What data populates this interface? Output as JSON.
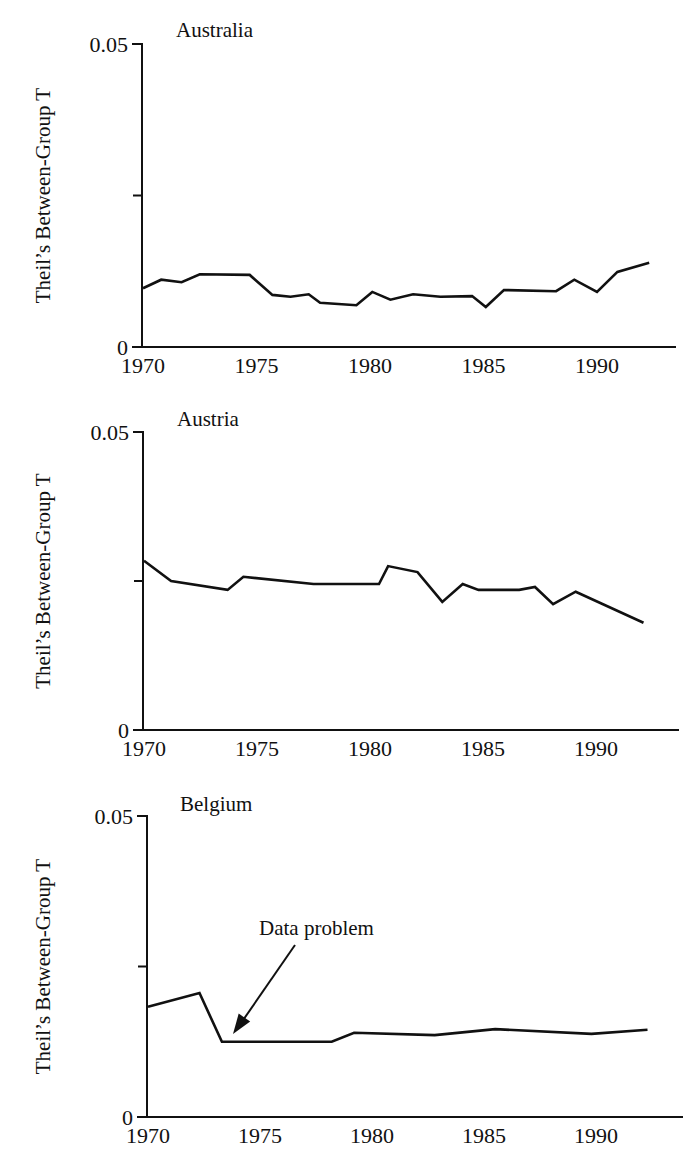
{
  "figure": {
    "y_axis_label": "Theil’s Between-Group T",
    "x_ticks": [
      "1970",
      "1975",
      "1980",
      "1985",
      "1990"
    ],
    "y_tick_top": "0.05",
    "y_tick_bottom": "0"
  },
  "chart_data": [
    {
      "type": "line",
      "title": "Australia",
      "xlabel": "",
      "ylabel": "Theil’s Between-Group T",
      "xlim": [
        1970,
        1993.5
      ],
      "ylim": [
        0,
        0.05
      ],
      "y_ticks": [
        0,
        0.025,
        0.05
      ],
      "y_tick_labels": [
        "0",
        "",
        "0.05"
      ],
      "x_ticks": [
        1970,
        1975,
        1980,
        1985,
        1990
      ],
      "grid": false,
      "x": [
        1970.0,
        1970.8,
        1971.7,
        1972.5,
        1974.7,
        1975.7,
        1976.5,
        1977.3,
        1977.8,
        1979.4,
        1980.1,
        1980.9,
        1981.9,
        1983.1,
        1984.5,
        1985.1,
        1985.9,
        1988.2,
        1989.0,
        1990.0,
        1990.9,
        1992.3
      ],
      "values": [
        0.0097,
        0.0111,
        0.0107,
        0.012,
        0.0119,
        0.0086,
        0.0083,
        0.0087,
        0.0073,
        0.0069,
        0.0091,
        0.0078,
        0.0087,
        0.0083,
        0.0084,
        0.0066,
        0.0094,
        0.0092,
        0.0111,
        0.0091,
        0.0124,
        0.0139
      ]
    },
    {
      "type": "line",
      "title": "Austria",
      "xlabel": "",
      "ylabel": "Theil’s Between-Group T",
      "xlim": [
        1970,
        1993.5
      ],
      "ylim": [
        0,
        0.05
      ],
      "y_ticks": [
        0,
        0.025,
        0.05
      ],
      "y_tick_labels": [
        "0",
        "",
        "0.05"
      ],
      "x_ticks": [
        1970,
        1975,
        1980,
        1985,
        1990
      ],
      "grid": false,
      "x": [
        1970.0,
        1971.2,
        1973.7,
        1974.4,
        1977.5,
        1980.4,
        1980.8,
        1982.1,
        1983.2,
        1984.1,
        1984.8,
        1986.6,
        1987.3,
        1988.1,
        1989.1,
        1992.1
      ],
      "values": [
        0.0284,
        0.025,
        0.0235,
        0.0257,
        0.0245,
        0.0245,
        0.0275,
        0.0265,
        0.0215,
        0.0245,
        0.0235,
        0.0235,
        0.024,
        0.0211,
        0.0232,
        0.018
      ]
    },
    {
      "type": "line",
      "title": "Belgium",
      "xlabel": "",
      "ylabel": "Theil’s Between-Group T",
      "xlim": [
        1970,
        1993.5
      ],
      "ylim": [
        0,
        0.05
      ],
      "y_ticks": [
        0,
        0.025,
        0.05
      ],
      "y_tick_labels": [
        "0",
        "",
        "0.05"
      ],
      "x_ticks": [
        1970,
        1975,
        1980,
        1985,
        1990
      ],
      "grid": false,
      "x": [
        1970.0,
        1972.3,
        1973.3,
        1978.2,
        1979.2,
        1982.8,
        1985.5,
        1989.8,
        1992.3
      ],
      "values": [
        0.0183,
        0.0206,
        0.0125,
        0.0125,
        0.014,
        0.0136,
        0.0146,
        0.0138,
        0.0145
      ],
      "annotations": [
        {
          "text": "Data problem",
          "arrow_to": [
            1973.4,
            0.0128
          ]
        }
      ]
    }
  ],
  "layout": {
    "panels": [
      {
        "axis_x": 142,
        "top_y": 44,
        "zero_y": 347,
        "x_end": 676,
        "x_1970": 143,
        "px_per_year": 22.7,
        "title_x": 176,
        "title_y": 37
      },
      {
        "axis_x": 143,
        "top_y": 432,
        "zero_y": 730,
        "x_end": 679,
        "x_1970": 144,
        "px_per_year": 22.6,
        "title_x": 177,
        "title_y": 426
      },
      {
        "axis_x": 147,
        "top_y": 816,
        "zero_y": 1117,
        "x_end": 683,
        "x_1970": 148,
        "px_per_year": 22.4,
        "title_x": 180,
        "title_y": 811
      }
    ],
    "annotation": {
      "text_x": 259,
      "text_y": 935,
      "arrow_from": [
        295,
        945
      ],
      "arrow_to": [
        233,
        1034
      ]
    }
  }
}
